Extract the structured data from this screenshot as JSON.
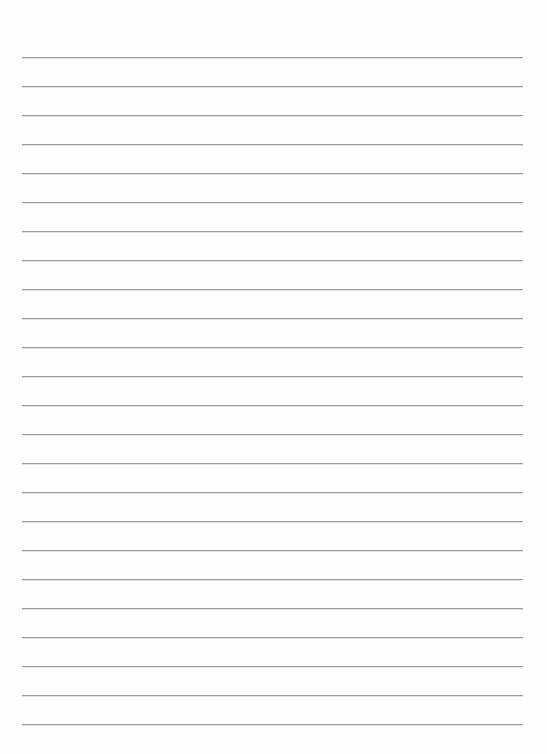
{
  "page": {
    "type": "lined-paper",
    "line_count": 24,
    "first_line_y": 57,
    "line_spacing": 29,
    "line_left": 22,
    "line_width": 501,
    "line_color": "#9c9c9c",
    "background_color": "#fefefe"
  }
}
